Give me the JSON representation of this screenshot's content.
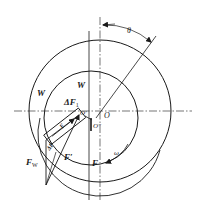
{
  "figure": {
    "type": "journal-bearing-force-diagram",
    "labels": {
      "theta": "θ",
      "w_outer": "W",
      "w_inner": "W",
      "delta_f1_main": "ΔF",
      "delta_f1_sub": "1",
      "f_w_main": "F",
      "f_w_sub": "W",
      "f_prime": "F′",
      "f": "F",
      "omega": "ω",
      "center_o": "O",
      "center_o_prime": "O′",
      "center_o_prime2": "O″",
      "f2_label": "F",
      "delta_f2": "ΔF"
    },
    "colors": {
      "stroke": "#1a1a1a",
      "background": "#ffffff"
    }
  }
}
